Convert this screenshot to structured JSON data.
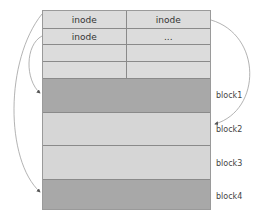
{
  "diagram": {
    "inode_table": {
      "rows": [
        {
          "left": "inode",
          "right": "inode"
        },
        {
          "left": "inode",
          "right": "..."
        },
        {
          "left": "",
          "right": ""
        },
        {
          "left": "",
          "right": ""
        }
      ]
    },
    "blocks": [
      {
        "label": "block1",
        "shade": "dark"
      },
      {
        "label": "block2",
        "shade": "light"
      },
      {
        "label": "block3",
        "shade": "light"
      },
      {
        "label": "block4",
        "shade": "dark"
      }
    ],
    "arrows": [
      {
        "from": "inode row1 left",
        "to": "block4"
      },
      {
        "from": "inode row2 left",
        "to": "block1"
      },
      {
        "from": "inode row1 right",
        "to": "block2"
      }
    ],
    "colors": {
      "inode_cell": "#dcdcdc",
      "block_dark": "#a8a8a8",
      "block_light": "#d6d6d6",
      "border": "#8a8a8a",
      "arrow": "#9a9a9a"
    }
  }
}
